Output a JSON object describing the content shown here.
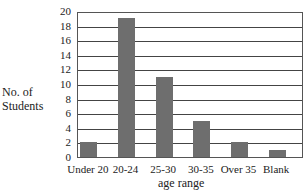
{
  "chart_data": {
    "type": "bar",
    "title": "",
    "xlabel": "age range",
    "ylabel": "No. of Students",
    "ylabel_lines": [
      "No. of",
      "Students"
    ],
    "categories": [
      "Under 20",
      "20-24",
      "25-30",
      "30-35",
      "Over 35",
      "Blank"
    ],
    "values": [
      2,
      19,
      11,
      5,
      2,
      1
    ],
    "ylim": [
      0,
      20
    ],
    "yticks": [
      0,
      2,
      4,
      6,
      8,
      10,
      12,
      14,
      16,
      18,
      20
    ],
    "grid": true,
    "legend": null,
    "bar_color": "#6e6e6e"
  }
}
